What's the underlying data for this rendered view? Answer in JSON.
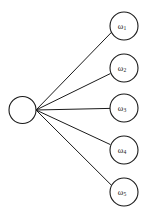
{
  "diagram": {
    "background_color": "#ffffff",
    "stroke_color": "#1a1a1a",
    "hub": {
      "label": "",
      "name": "hub-node",
      "cx": 22.5,
      "cy": 110,
      "r": 13.5
    },
    "edge_origin": {
      "x": 36,
      "y": 110
    },
    "leaf_radius": 14,
    "leaf_cx": 124,
    "leaves": [
      {
        "label": "ω",
        "subscript": "1",
        "full": "ω1",
        "cy": 26
      },
      {
        "label": "ω",
        "subscript": "2",
        "full": "ω2",
        "cy": 68
      },
      {
        "label": "ω",
        "subscript": "3",
        "full": "ω3",
        "cy": 108
      },
      {
        "label": "ω",
        "subscript": "4",
        "full": "ω4",
        "cy": 150
      },
      {
        "label": "ω",
        "subscript": "5",
        "full": "ω5",
        "cy": 192
      }
    ],
    "edges": [
      {
        "from": "hub-node",
        "to": "node-omega-1"
      },
      {
        "from": "hub-node",
        "to": "node-omega-2"
      },
      {
        "from": "hub-node",
        "to": "node-omega-3"
      },
      {
        "from": "hub-node",
        "to": "node-omega-4"
      },
      {
        "from": "hub-node",
        "to": "node-omega-5"
      }
    ]
  }
}
